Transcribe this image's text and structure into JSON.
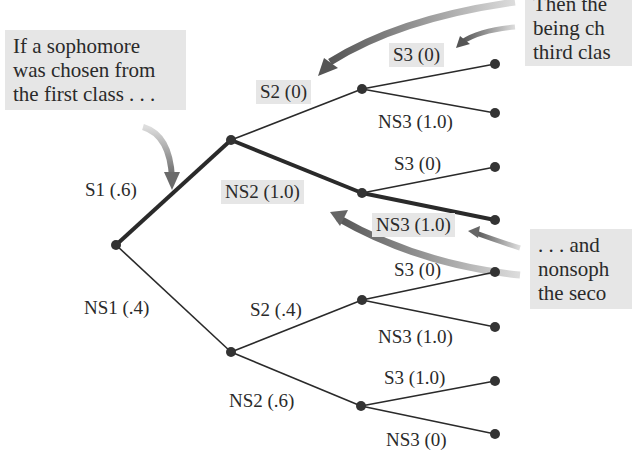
{
  "callouts": {
    "top_left": [
      "If a sophomore",
      "was chosen from",
      "the first class . . ."
    ],
    "top_right": [
      "Then the",
      "being ch",
      "third clas"
    ],
    "mid_right": [
      ". . . and",
      "nonsoph",
      "the seco"
    ]
  },
  "branches": {
    "s1": "S1 (.6)",
    "ns1": "NS1 (.4)",
    "s1_s2": "S2 (0)",
    "s1_ns2": "NS2 (1.0)",
    "ns1_s2": "S2 (.4)",
    "ns1_ns2": "NS2 (.6)",
    "s1_s2_s3": "S3 (0)",
    "s1_s2_ns3": "NS3 (1.0)",
    "s1_ns2_s3": "S3 (0)",
    "s1_ns2_ns3": "NS3 (1.0)",
    "ns1_s2_s3": "S3 (0)",
    "ns1_s2_ns3": "NS3 (1.0)",
    "ns1_ns2_s3": "S3 (1.0)",
    "ns1_ns2_ns3": "NS3 (0)"
  },
  "colors": {
    "line": "#2a2a2a",
    "highlight_box": "#e6e6e6",
    "arrow": "#6f6f6f"
  }
}
